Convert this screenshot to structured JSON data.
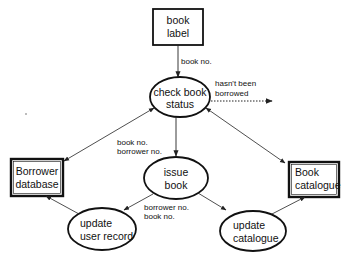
{
  "diagram": {
    "type": "data-flow",
    "nodes": {
      "book_label": {
        "shape": "box",
        "line1": "book",
        "line2": "label"
      },
      "check_status": {
        "shape": "ellipse",
        "line1": "check book",
        "line2": "status"
      },
      "borrower_db": {
        "shape": "box-double",
        "line1": "Borrower",
        "line2": "database"
      },
      "issue_book": {
        "shape": "ellipse",
        "line1": "issue",
        "line2": "book"
      },
      "book_catalogue": {
        "shape": "box-double",
        "line1": "Book",
        "line2": "catalogue"
      },
      "update_user": {
        "shape": "ellipse",
        "line1": "update",
        "line2": "user record"
      },
      "update_catalogue": {
        "shape": "ellipse",
        "line1": "update",
        "line2": "catalogue"
      }
    },
    "edges": [
      {
        "from": "book label",
        "to": "check book status",
        "label": "book no.",
        "style": "solid"
      },
      {
        "from": "check book status",
        "to": "external",
        "label_line1": "hasn't been",
        "label_line2": "borrowed",
        "style": "dotted"
      },
      {
        "from": "check book status",
        "to": "Borrower database",
        "style": "solid-bidirectional"
      },
      {
        "from": "check book status",
        "to": "Book catalogue",
        "style": "solid-bidirectional"
      },
      {
        "from": "check book status",
        "to": "issue book",
        "label_line1": "book no.",
        "label_line2": "borrower no.",
        "style": "solid"
      },
      {
        "from": "issue book",
        "to": "update user record",
        "label_line1": "borrower no.",
        "label_line2": "book no.",
        "style": "solid"
      },
      {
        "from": "issue book",
        "to": "update catalogue",
        "style": "solid"
      },
      {
        "from": "update user record",
        "to": "Borrower database",
        "style": "solid"
      },
      {
        "from": "update catalogue",
        "to": "Book catalogue",
        "style": "solid"
      }
    ],
    "labels": {
      "book_no": "book no.",
      "not_borrowed_1": "hasn't been",
      "not_borrowed_2": "borrowed",
      "issue_in_1": "book no.",
      "issue_in_2": "borrower no.",
      "issue_out_1": "borrower no.",
      "issue_out_2": "book no."
    }
  }
}
